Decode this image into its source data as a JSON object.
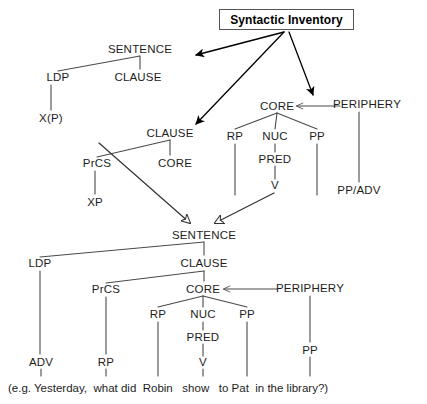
{
  "title": {
    "text": "Syntactic Inventory",
    "box_border_color": "#555555"
  },
  "colors": {
    "line": "#4a4a4a",
    "arrow_solid": "#000000",
    "arrow_hollow_stroke": "#333333",
    "text": "#1d1d1d",
    "background": "#ffffff"
  },
  "trees": {
    "sentence_template": {
      "name": "sentence-template",
      "nodes": [
        {
          "id": "t-sentence",
          "label": "SENTENCE",
          "x": 140,
          "y": 49
        },
        {
          "id": "t-ldp",
          "label": "LDP",
          "x": 58,
          "y": 77
        },
        {
          "id": "t-clause",
          "label": "CLAUSE",
          "x": 138,
          "y": 77
        },
        {
          "id": "t-xp",
          "label": "X(P)",
          "x": 51,
          "y": 118
        }
      ]
    },
    "clause_template": {
      "name": "clause-template",
      "nodes": [
        {
          "id": "c-clause",
          "label": "CLAUSE",
          "x": 170,
          "y": 133
        },
        {
          "id": "c-prcs",
          "label": "PrCS",
          "x": 97,
          "y": 163
        },
        {
          "id": "c-core",
          "label": "CORE",
          "x": 175,
          "y": 163
        },
        {
          "id": "c-xp",
          "label": "XP",
          "x": 95,
          "y": 202
        }
      ]
    },
    "core_template": {
      "name": "core-template",
      "nodes": [
        {
          "id": "k-core",
          "label": "CORE",
          "x": 277,
          "y": 106
        },
        {
          "id": "k-periphery",
          "label": "PERIPHERY",
          "x": 367,
          "y": 104
        },
        {
          "id": "k-rp",
          "label": "RP",
          "x": 235,
          "y": 136
        },
        {
          "id": "k-nuc",
          "label": "NUC",
          "x": 275,
          "y": 136
        },
        {
          "id": "k-pp",
          "label": "PP",
          "x": 317,
          "y": 136
        },
        {
          "id": "k-pred",
          "label": "PRED",
          "x": 275,
          "y": 159
        },
        {
          "id": "k-v",
          "label": "V",
          "x": 275,
          "y": 185
        },
        {
          "id": "k-ppadv",
          "label": "PP/ADV",
          "x": 359,
          "y": 190
        }
      ]
    },
    "example_tree": {
      "name": "example-tree",
      "nodes": [
        {
          "id": "e-sentence",
          "label": "SENTENCE",
          "x": 204,
          "y": 235
        },
        {
          "id": "e-ldp",
          "label": "LDP",
          "x": 40,
          "y": 263
        },
        {
          "id": "e-clause",
          "label": "CLAUSE",
          "x": 204,
          "y": 263
        },
        {
          "id": "e-prcs",
          "label": "PrCS",
          "x": 106,
          "y": 289
        },
        {
          "id": "e-core",
          "label": "CORE",
          "x": 203,
          "y": 289
        },
        {
          "id": "e-periphery",
          "label": "PERIPHERY",
          "x": 310,
          "y": 288
        },
        {
          "id": "e-rp1",
          "label": "RP",
          "x": 158,
          "y": 314
        },
        {
          "id": "e-nuc",
          "label": "NUC",
          "x": 203,
          "y": 314
        },
        {
          "id": "e-pp1",
          "label": "PP",
          "x": 247,
          "y": 314
        },
        {
          "id": "e-pred",
          "label": "PRED",
          "x": 203,
          "y": 337
        },
        {
          "id": "e-adv",
          "label": "ADV",
          "x": 41,
          "y": 362
        },
        {
          "id": "e-rp2",
          "label": "RP",
          "x": 106,
          "y": 362
        },
        {
          "id": "e-v",
          "label": "V",
          "x": 203,
          "y": 362
        },
        {
          "id": "e-pp2",
          "label": "PP",
          "x": 310,
          "y": 350
        }
      ]
    }
  },
  "gloss": {
    "full_text": "(e.g. Yesterday, what did Robin  show  to Pat  in the library?)",
    "words": [
      {
        "text": "(e.g. Yesterday,",
        "x": 8
      },
      {
        "text": "what did",
        "x": 92
      },
      {
        "text": "Robin",
        "x": 143
      },
      {
        "text": "show",
        "x": 190
      },
      {
        "text": "to Pat",
        "x": 236
      },
      {
        "text": "in the library?)",
        "x": 283
      }
    ]
  },
  "annotations": {
    "arrow_to_sentence_template": "title-to-sentence-arrow",
    "arrow_to_clause_template": "title-to-clause-arrow",
    "arrow_to_core_template": "title-to-core-arrow",
    "hollow_arrow_left": "clause-expansion-arrow",
    "hollow_arrow_right": "core-expansion-arrow",
    "periphery_arrow_top": "periphery-modifies-core-arrow",
    "periphery_arrow_bottom": "periphery-modifies-core-arrow-example"
  }
}
